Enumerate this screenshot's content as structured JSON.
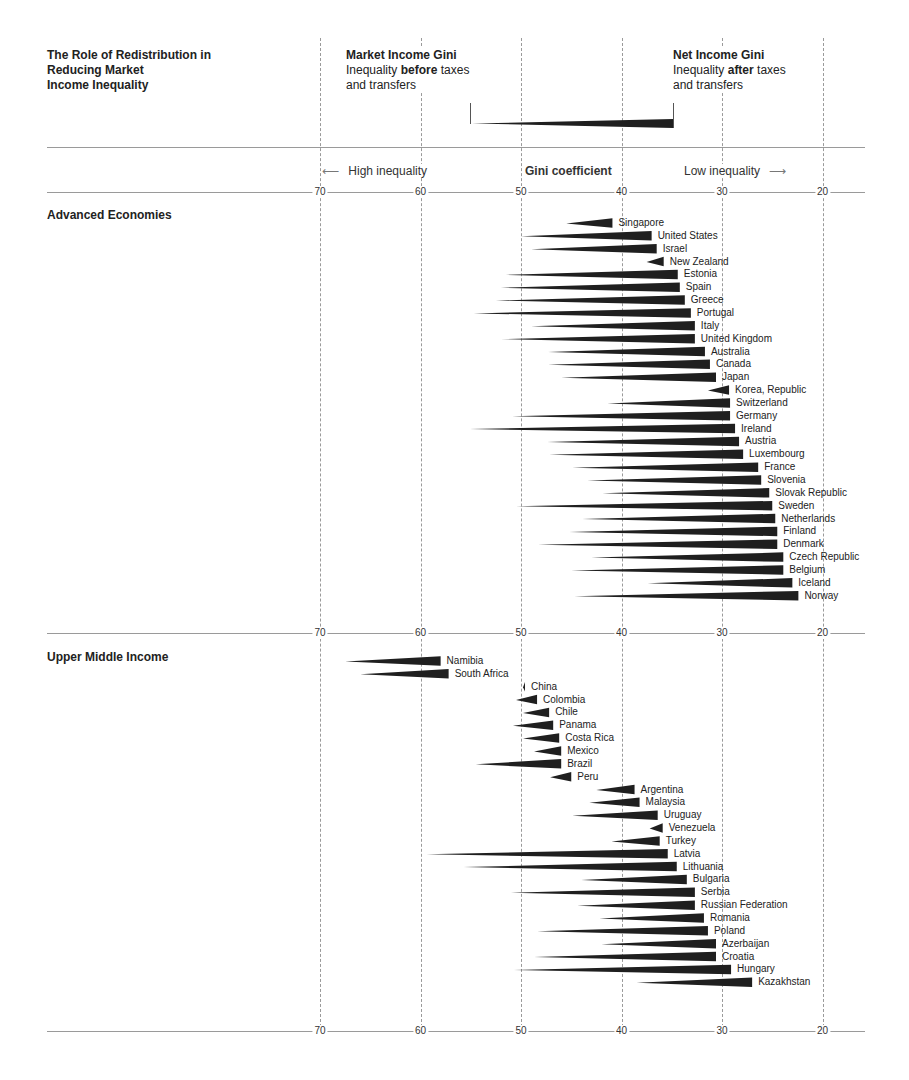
{
  "header": {
    "title_lines": [
      "The Role of Redistribution in",
      "Reducing Market",
      "Income Inequality"
    ],
    "market_label": "Market Income Gini",
    "market_desc_pre": "Inequality ",
    "market_desc_bold": "before",
    "market_desc_post": " taxes",
    "market_desc_line2": "and transfers",
    "net_label": "Net Income Gini",
    "net_desc_pre": "Inequality ",
    "net_desc_bold": "after",
    "net_desc_post": " taxes",
    "net_desc_line2": "and transfers",
    "high_inequality": "High inequality",
    "gini_coefficient": "Gini coefficient",
    "low_inequality": "Low inequality",
    "arrow_left": "⟵",
    "arrow_right": "⟶"
  },
  "axis": {
    "ticks": [
      "70",
      "60",
      "50",
      "40",
      "30",
      "20"
    ]
  },
  "colors": {
    "wedge": "#1f1f1f",
    "grid": "#9a9a9a",
    "text": "#222222"
  },
  "chart_data": {
    "type": "bar",
    "title": "The Role of Redistribution in Reducing Market Income Inequality",
    "xlabel": "Gini coefficient",
    "ylabel": "",
    "xlim": [
      70,
      20
    ],
    "x_reversed": true,
    "grid": true,
    "legend": [
      "Market Income Gini (inequality before taxes and transfers)",
      "Net Income Gini (inequality after taxes and transfers)"
    ],
    "annotations": [
      "High inequality",
      "Low inequality"
    ],
    "groups": [
      {
        "name": "Advanced Economies",
        "countries": [
          {
            "country": "Singapore",
            "market": 45.5,
            "net": 40.9
          },
          {
            "country": "United States",
            "market": 50.0,
            "net": 37.0
          },
          {
            "country": "Israel",
            "market": 49.0,
            "net": 36.5
          },
          {
            "country": "New Zealand",
            "market": 37.5,
            "net": 35.8
          },
          {
            "country": "Estonia",
            "market": 51.5,
            "net": 34.4
          },
          {
            "country": "Spain",
            "market": 52.0,
            "net": 34.2
          },
          {
            "country": "Greece",
            "market": 52.5,
            "net": 33.7
          },
          {
            "country": "Portugal",
            "market": 54.7,
            "net": 33.1
          },
          {
            "country": "Italy",
            "market": 49.0,
            "net": 32.7
          },
          {
            "country": "United Kingdom",
            "market": 52.0,
            "net": 32.7
          },
          {
            "country": "Australia",
            "market": 47.3,
            "net": 31.7
          },
          {
            "country": "Canada",
            "market": 47.3,
            "net": 31.2
          },
          {
            "country": "Japan",
            "market": 46.0,
            "net": 30.6
          },
          {
            "country": "Korea, Republic",
            "market": 31.4,
            "net": 29.3
          },
          {
            "country": "Switzerland",
            "market": 41.4,
            "net": 29.2
          },
          {
            "country": "Germany",
            "market": 50.9,
            "net": 29.2
          },
          {
            "country": "Ireland",
            "market": 55.1,
            "net": 28.7
          },
          {
            "country": "Austria",
            "market": 47.4,
            "net": 28.3
          },
          {
            "country": "Luxembourg",
            "market": 47.2,
            "net": 27.9
          },
          {
            "country": "France",
            "market": 44.9,
            "net": 26.4
          },
          {
            "country": "Slovenia",
            "market": 43.4,
            "net": 26.1
          },
          {
            "country": "Slovak Republic",
            "market": 41.9,
            "net": 25.3
          },
          {
            "country": "Sweden",
            "market": 50.5,
            "net": 25.0
          },
          {
            "country": "Netherlands",
            "market": 43.9,
            "net": 24.7
          },
          {
            "country": "Finland",
            "market": 45.2,
            "net": 24.5
          },
          {
            "country": "Denmark",
            "market": 48.3,
            "net": 24.5
          },
          {
            "country": "Czech Republic",
            "market": 43.0,
            "net": 23.9
          },
          {
            "country": "Belgium",
            "market": 45.0,
            "net": 23.9
          },
          {
            "country": "Iceland",
            "market": 37.4,
            "net": 23.0
          },
          {
            "country": "Norway",
            "market": 44.7,
            "net": 22.4
          }
        ]
      },
      {
        "name": "Upper Middle Income",
        "countries": [
          {
            "country": "Namibia",
            "market": 67.5,
            "net": 58.0
          },
          {
            "country": "South Africa",
            "market": 66.0,
            "net": 57.2
          },
          {
            "country": "China",
            "market": 49.8,
            "net": 49.6
          },
          {
            "country": "Colombia",
            "market": 50.5,
            "net": 48.4
          },
          {
            "country": "Chile",
            "market": 49.8,
            "net": 47.2
          },
          {
            "country": "Panama",
            "market": 50.8,
            "net": 46.8
          },
          {
            "country": "Costa Rica",
            "market": 49.8,
            "net": 46.2
          },
          {
            "country": "Mexico",
            "market": 48.7,
            "net": 46.0
          },
          {
            "country": "Brazil",
            "market": 54.5,
            "net": 46.0
          },
          {
            "country": "Peru",
            "market": 47.1,
            "net": 45.0
          },
          {
            "country": "Argentina",
            "market": 42.5,
            "net": 38.7
          },
          {
            "country": "Malaysia",
            "market": 43.2,
            "net": 38.2
          },
          {
            "country": "Uruguay",
            "market": 44.9,
            "net": 36.4
          },
          {
            "country": "Venezuela",
            "market": 37.2,
            "net": 35.9
          },
          {
            "country": "Turkey",
            "market": 41.0,
            "net": 36.2
          },
          {
            "country": "Latvia",
            "market": 59.4,
            "net": 35.4
          },
          {
            "country": "Lithuania",
            "market": 55.7,
            "net": 34.5
          },
          {
            "country": "Bulgaria",
            "market": 44.0,
            "net": 33.5
          },
          {
            "country": "Serbia",
            "market": 51.0,
            "net": 32.7
          },
          {
            "country": "Russian Federation",
            "market": 44.4,
            "net": 32.7
          },
          {
            "country": "Romania",
            "market": 42.2,
            "net": 31.8
          },
          {
            "country": "Poland",
            "market": 48.4,
            "net": 31.4
          },
          {
            "country": "Azerbaijan",
            "market": 42.0,
            "net": 30.6
          },
          {
            "country": "Croatia",
            "market": 48.7,
            "net": 30.6
          },
          {
            "country": "Hungary",
            "market": 50.7,
            "net": 29.1
          },
          {
            "country": "Kazakhstan",
            "market": 38.5,
            "net": 27.0
          }
        ]
      }
    ]
  }
}
